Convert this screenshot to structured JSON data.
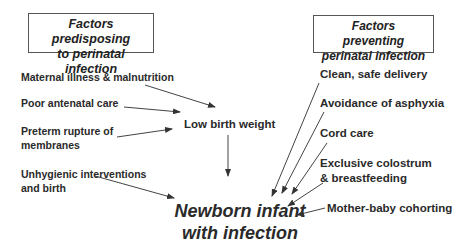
{
  "boxes": {
    "predisposing_line1": "Factors predisposing",
    "predisposing_line2": "to perinatal infection",
    "preventing_line1": "Factors preventing",
    "preventing_line2": "perinatal infection"
  },
  "predisposing_factors": [
    {
      "line1": "Maternal illness & malnutrition"
    },
    {
      "line1": "Poor antenatal care"
    },
    {
      "line1": "Preterm rupture of",
      "line2": "membranes"
    },
    {
      "line1": "Unhygienic interventions",
      "line2": "and birth"
    }
  ],
  "intermediate": "Low birth weight",
  "preventing_factors": [
    {
      "line1": "Clean, safe delivery"
    },
    {
      "line1": "Avoidance of asphyxia"
    },
    {
      "line1": "Cord care"
    },
    {
      "line1": "Exclusive colostrum",
      "line2": "& breastfeeding"
    },
    {
      "line1": "Mother-baby cohorting"
    }
  ],
  "outcome": {
    "line1": "Newborn infant",
    "line2": "with infection"
  }
}
